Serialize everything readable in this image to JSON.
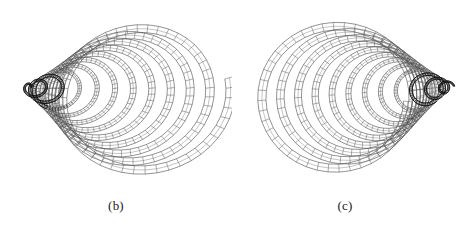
{
  "figure": {
    "background_color": "#ffffff",
    "ink_color": "#2b2b2b",
    "panels": [
      {
        "id": "b",
        "label": "(b)",
        "view": "oblique three-quarter view of a conical coiled tube, opening toward the viewer at right, tapering to a dark narrow tail at the left",
        "geometry": {
          "type": "conical-helix-ribbon",
          "turns": 11,
          "segments_per_turn": 46,
          "center_x": 148,
          "center_y": 98,
          "radius_max": 84,
          "radius_min": 5,
          "tube_width_max": 9.5,
          "tube_width_min": 1.6,
          "axis_tilt_deg": -14,
          "perspective_squash": 0.88,
          "tail_tip_x": 16,
          "tail_tip_y": 92
        }
      },
      {
        "id": "c",
        "label": "(c)",
        "view": "side view of the same coiled tube seen nearly along its axis, with a dark concentric spiral core at the left and wide open loops sweeping to the right",
        "geometry": {
          "type": "conical-helix-ribbon",
          "turns": 12,
          "segments_per_turn": 44,
          "center_x": 98,
          "center_y": 96,
          "radius_max": 78,
          "radius_min": 4,
          "tube_width_max": 8.5,
          "tube_width_min": 1.4,
          "axis_tilt_deg": 4,
          "perspective_squash": 0.95,
          "core_x": 58,
          "core_y": 84,
          "sweep_x": 120
        }
      }
    ]
  }
}
